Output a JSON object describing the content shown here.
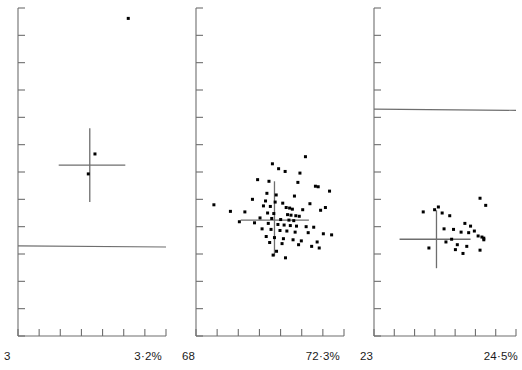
{
  "figure": {
    "title": "",
    "background": "#ffffff",
    "width": 522,
    "height": 370,
    "ink_color": "#111111",
    "axis_color": "#6e6e6e",
    "point_color": "#000000"
  },
  "chart_data": [
    {
      "type": "scatter",
      "panel_index": 0,
      "title": "",
      "xlabel": "",
      "ylabel": "",
      "x_axis_min_label": "3",
      "x_axis_max_label": "3·2%",
      "xlim": [
        3.0,
        3.2
      ],
      "ylim": [
        0,
        12
      ],
      "x_tick_count": 7,
      "y_tick_count": 12,
      "grid": false,
      "legend": "none",
      "n_points": 3,
      "points": [
        {
          "x": 3.149,
          "y": 11.62
        },
        {
          "x": 3.104,
          "y": 6.66
        },
        {
          "x": 3.095,
          "y": 5.93
        }
      ],
      "crosshair": {
        "x": 3.097,
        "y": 6.25,
        "x_low": 3.055,
        "x_high": 3.145,
        "y_low": 4.9,
        "y_high": 7.6
      },
      "reference_line": {
        "y": 3.3,
        "label": ""
      }
    },
    {
      "type": "scatter",
      "panel_index": 1,
      "title": "",
      "xlabel": "",
      "ylabel": "",
      "x_axis_min_label": "68",
      "x_axis_max_label": "72·3%",
      "xlim": [
        68.0,
        72.3
      ],
      "ylim": [
        0,
        12
      ],
      "x_tick_count": 7,
      "y_tick_count": 12,
      "grid": false,
      "legend": "none",
      "n_points": 72,
      "points": [
        {
          "x": 71.18,
          "y": 6.56
        },
        {
          "x": 70.22,
          "y": 6.3
        },
        {
          "x": 70.4,
          "y": 6.12
        },
        {
          "x": 70.59,
          "y": 6.02
        },
        {
          "x": 71.02,
          "y": 5.96
        },
        {
          "x": 69.79,
          "y": 5.72
        },
        {
          "x": 70.12,
          "y": 5.66
        },
        {
          "x": 70.96,
          "y": 5.62
        },
        {
          "x": 71.47,
          "y": 5.48
        },
        {
          "x": 71.55,
          "y": 5.46
        },
        {
          "x": 71.88,
          "y": 5.3
        },
        {
          "x": 70.06,
          "y": 5.22
        },
        {
          "x": 70.33,
          "y": 5.16
        },
        {
          "x": 70.86,
          "y": 5.12
        },
        {
          "x": 69.64,
          "y": 5.0
        },
        {
          "x": 70.02,
          "y": 4.94
        },
        {
          "x": 70.3,
          "y": 4.9
        },
        {
          "x": 70.52,
          "y": 4.86
        },
        {
          "x": 71.31,
          "y": 4.84
        },
        {
          "x": 68.52,
          "y": 4.8
        },
        {
          "x": 69.96,
          "y": 4.76
        },
        {
          "x": 70.16,
          "y": 4.74
        },
        {
          "x": 70.62,
          "y": 4.7
        },
        {
          "x": 70.72,
          "y": 4.68
        },
        {
          "x": 70.8,
          "y": 4.64
        },
        {
          "x": 71.1,
          "y": 4.62
        },
        {
          "x": 71.62,
          "y": 4.6
        },
        {
          "x": 69.0,
          "y": 4.56
        },
        {
          "x": 69.42,
          "y": 4.54
        },
        {
          "x": 70.08,
          "y": 4.5
        },
        {
          "x": 70.26,
          "y": 4.48
        },
        {
          "x": 70.66,
          "y": 4.44
        },
        {
          "x": 70.76,
          "y": 4.42
        },
        {
          "x": 70.9,
          "y": 4.4
        },
        {
          "x": 71.0,
          "y": 4.38
        },
        {
          "x": 69.86,
          "y": 4.32
        },
        {
          "x": 70.2,
          "y": 4.3
        },
        {
          "x": 70.46,
          "y": 4.26
        },
        {
          "x": 70.7,
          "y": 4.24
        },
        {
          "x": 70.84,
          "y": 4.22
        },
        {
          "x": 69.26,
          "y": 4.18
        },
        {
          "x": 69.7,
          "y": 4.14
        },
        {
          "x": 70.1,
          "y": 4.12
        },
        {
          "x": 70.38,
          "y": 4.08
        },
        {
          "x": 70.56,
          "y": 4.06
        },
        {
          "x": 70.74,
          "y": 4.04
        },
        {
          "x": 70.92,
          "y": 4.02
        },
        {
          "x": 71.2,
          "y": 4.0
        },
        {
          "x": 71.42,
          "y": 3.98
        },
        {
          "x": 69.92,
          "y": 3.92
        },
        {
          "x": 70.18,
          "y": 3.9
        },
        {
          "x": 70.44,
          "y": 3.86
        },
        {
          "x": 70.64,
          "y": 3.84
        },
        {
          "x": 70.88,
          "y": 3.8
        },
        {
          "x": 71.26,
          "y": 3.78
        },
        {
          "x": 71.7,
          "y": 3.74
        },
        {
          "x": 71.94,
          "y": 3.7
        },
        {
          "x": 70.04,
          "y": 3.64
        },
        {
          "x": 70.28,
          "y": 3.6
        },
        {
          "x": 70.54,
          "y": 3.56
        },
        {
          "x": 70.82,
          "y": 3.52
        },
        {
          "x": 71.06,
          "y": 3.48
        },
        {
          "x": 70.14,
          "y": 3.42
        },
        {
          "x": 70.5,
          "y": 3.38
        },
        {
          "x": 70.98,
          "y": 3.34
        },
        {
          "x": 71.36,
          "y": 3.28
        },
        {
          "x": 71.58,
          "y": 3.22
        },
        {
          "x": 70.34,
          "y": 3.1
        },
        {
          "x": 70.24,
          "y": 2.96
        },
        {
          "x": 70.6,
          "y": 2.86
        },
        {
          "x": 71.52,
          "y": 3.44
        },
        {
          "x": 71.76,
          "y": 4.7
        }
      ],
      "crosshair": {
        "x": 70.28,
        "y": 4.24,
        "x_low": 69.3,
        "x_high": 71.28,
        "y_low": 2.92,
        "y_high": 5.66
      },
      "reference_line": null
    },
    {
      "type": "scatter",
      "panel_index": 2,
      "title": "",
      "xlabel": "",
      "ylabel": "",
      "x_axis_min_label": "23",
      "x_axis_max_label": "24·5%",
      "xlim": [
        23.0,
        24.5
      ],
      "ylim": [
        0,
        12
      ],
      "x_tick_count": 7,
      "y_tick_count": 12,
      "grid": false,
      "legend": "none",
      "n_points": 26,
      "points": [
        {
          "x": 24.12,
          "y": 5.04
        },
        {
          "x": 24.18,
          "y": 4.78
        },
        {
          "x": 23.68,
          "y": 4.72
        },
        {
          "x": 23.52,
          "y": 4.54
        },
        {
          "x": 23.72,
          "y": 4.5
        },
        {
          "x": 23.8,
          "y": 4.4
        },
        {
          "x": 23.96,
          "y": 4.12
        },
        {
          "x": 24.02,
          "y": 4.02
        },
        {
          "x": 23.74,
          "y": 3.92
        },
        {
          "x": 23.84,
          "y": 3.9
        },
        {
          "x": 24.06,
          "y": 3.84
        },
        {
          "x": 23.92,
          "y": 3.8
        },
        {
          "x": 24.0,
          "y": 3.78
        },
        {
          "x": 24.1,
          "y": 3.66
        },
        {
          "x": 24.14,
          "y": 3.62
        },
        {
          "x": 24.16,
          "y": 3.58
        },
        {
          "x": 23.82,
          "y": 3.54
        },
        {
          "x": 24.16,
          "y": 3.52
        },
        {
          "x": 23.76,
          "y": 3.44
        },
        {
          "x": 23.88,
          "y": 3.34
        },
        {
          "x": 23.98,
          "y": 3.28
        },
        {
          "x": 23.58,
          "y": 3.22
        },
        {
          "x": 23.86,
          "y": 3.16
        },
        {
          "x": 24.12,
          "y": 3.14
        },
        {
          "x": 23.94,
          "y": 3.02
        },
        {
          "x": 23.64,
          "y": 4.62
        }
      ],
      "crosshair": {
        "x": 23.66,
        "y": 3.54,
        "x_low": 23.27,
        "x_high": 24.02,
        "y_low": 2.48,
        "y_high": 4.6
      },
      "reference_line": {
        "y": 8.3,
        "label": ""
      }
    }
  ]
}
